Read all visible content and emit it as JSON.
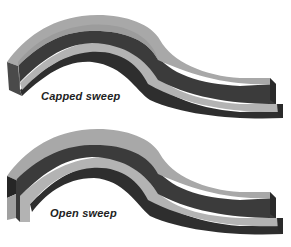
{
  "figures": [
    {
      "id": "capped",
      "caption": "Capped sweep",
      "end_style": "capped"
    },
    {
      "id": "open",
      "caption": "Open sweep",
      "end_style": "open"
    }
  ],
  "colors": {
    "background": "#ffffff",
    "top_surface": "#a9a9a9",
    "wall_dark": "#3a3a3a",
    "wall_darker": "#2a2a2a",
    "ledge_light": "#b4b4b4",
    "caption_text": "#222222"
  }
}
